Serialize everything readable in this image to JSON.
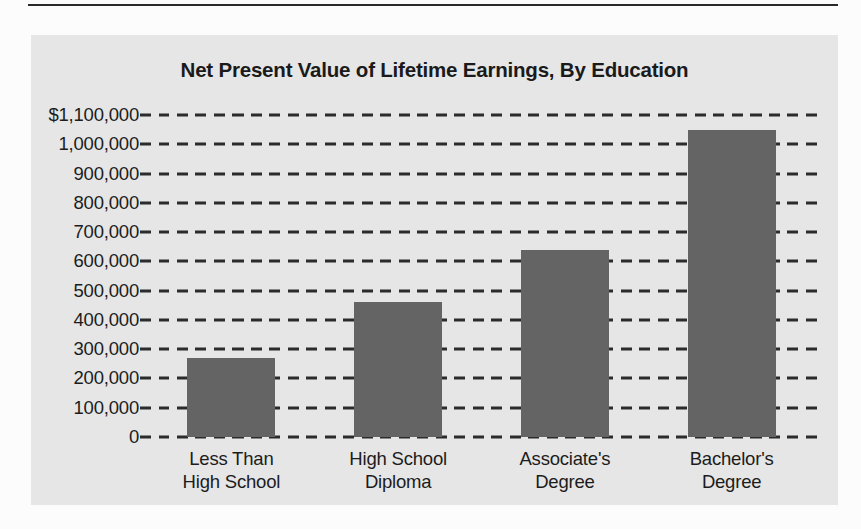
{
  "page": {
    "background_color": "#fcfcfc",
    "rule_color": "#2a2a2a"
  },
  "figure": {
    "panel_color": "#e6e6e6",
    "title": "Net Present Value of Lifetime Earnings, By Education"
  },
  "chart_data": {
    "type": "bar",
    "title": "Net Present Value of Lifetime Earnings, By Education",
    "xlabel": "",
    "ylabel": "",
    "categories": [
      "Less Than High School",
      "High School Diploma",
      "Associate's Degree",
      "Bachelor's Degree"
    ],
    "category_lines": [
      [
        "Less Than",
        "High School"
      ],
      [
        "High School",
        "Diploma"
      ],
      [
        "Associate's",
        "Degree"
      ],
      [
        "Bachelor's",
        "Degree"
      ]
    ],
    "values": [
      270000,
      460000,
      640000,
      1050000
    ],
    "ylim": [
      0,
      1100000
    ],
    "ytick_values": [
      1100000,
      1000000,
      900000,
      800000,
      700000,
      600000,
      500000,
      400000,
      300000,
      200000,
      100000,
      0
    ],
    "ytick_labels": [
      "$1,100,000",
      "1,000,000",
      "900,000",
      "800,000",
      "700,000",
      "600,000",
      "500,000",
      "400,000",
      "300,000",
      "200,000",
      "100,000",
      "0"
    ],
    "grid": true,
    "grid_style": "dashed",
    "grid_color": "#2b2b2b",
    "bar_color": "#646464",
    "legend": null,
    "legend_position": "none"
  }
}
